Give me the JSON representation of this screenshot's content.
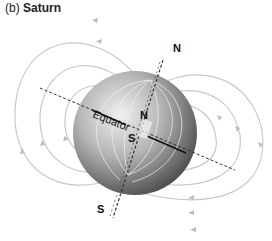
{
  "figure": {
    "panel_label": "(b)",
    "title": "Saturn",
    "labels": {
      "north_axis": "N",
      "south_axis": "S",
      "north_pole": "N",
      "south_pole": "S",
      "equator": "Equator"
    },
    "colors": {
      "field_lines": "#c8c8c8",
      "planet_light": "#e8e8e8",
      "planet_dark": "#4a4a4a",
      "axis_dash": "#333333",
      "text": "#111111"
    }
  }
}
